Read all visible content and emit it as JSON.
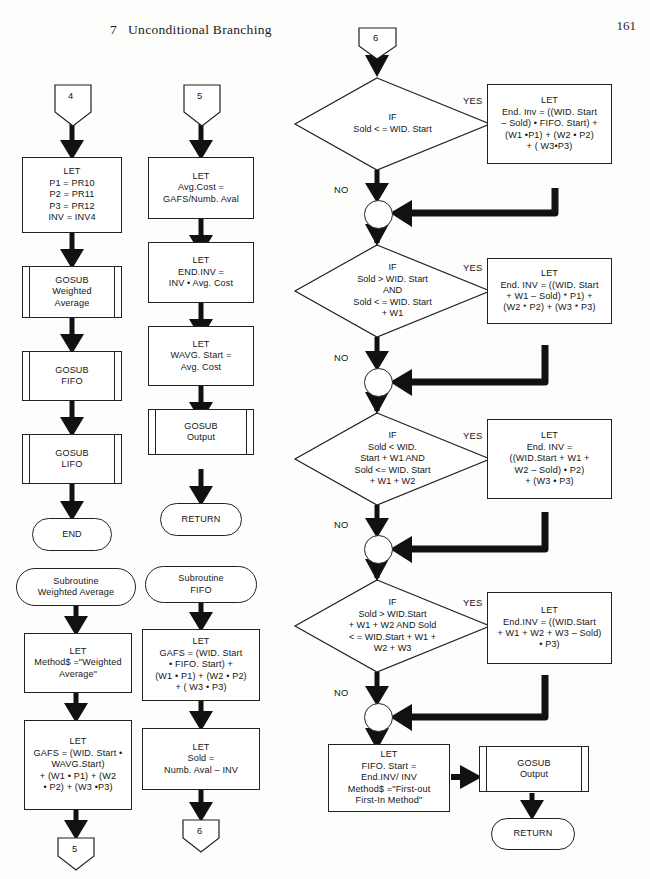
{
  "header": {
    "chapter_number": "7",
    "chapter_title": "Unconditional Branching",
    "page_number": "161"
  },
  "labels": {
    "yes": "YES",
    "no": "NO"
  },
  "column1": {
    "entry_connector": "4",
    "nodes": [
      {
        "id": "c1-let1",
        "type": "process",
        "text": "LET\nP1 = PR10\nP2 = PR11\nP3 = PR12\nINV = INV4"
      },
      {
        "id": "c1-sub1",
        "type": "subroutine",
        "text": "GOSUB\nWeighted\nAverage"
      },
      {
        "id": "c1-sub2",
        "type": "subroutine",
        "text": "GOSUB\nFIFO"
      },
      {
        "id": "c1-sub3",
        "type": "subroutine",
        "text": "GOSUB\nLIFO"
      },
      {
        "id": "c1-end",
        "type": "terminator",
        "text": "END"
      }
    ]
  },
  "column2": {
    "entry_connector": "5",
    "nodes": [
      {
        "id": "c2-let1",
        "type": "process",
        "text": "LET\nAvg.Cost =\nGAFS/Numb. Aval"
      },
      {
        "id": "c2-let2",
        "type": "process",
        "text": "LET\nEND.INV =\nINV • Avg. Cost"
      },
      {
        "id": "c2-let3",
        "type": "process",
        "text": "LET\nWAVG. Start =\nAvg. Cost"
      },
      {
        "id": "c2-sub1",
        "type": "subroutine",
        "text": "GOSUB\nOutput"
      },
      {
        "id": "c2-ret",
        "type": "terminator",
        "text": "RETURN"
      }
    ]
  },
  "subroutine_weighted_average": {
    "start_label": "Subroutine\nWeighted Average",
    "nodes": [
      {
        "id": "wa-let1",
        "type": "process",
        "text": "LET\nMethod$ =\"Weighted\nAverage\""
      },
      {
        "id": "wa-let2",
        "type": "process",
        "text": "LET\nGAFS = (WID. Start •\nWAVG.Start)\n+ (W1 • P1) + (W2\n• P2) + (W3 •P3)"
      }
    ],
    "exit_connector": "5"
  },
  "subroutine_fifo": {
    "start_label": "Subroutine\nFIFO",
    "nodes": [
      {
        "id": "fi-let1",
        "type": "process",
        "text": "LET\nGAFS = (WID. Start\n• FIFO. Start) +\n(W1 • P1) + (W2 • P2)\n+ ( W3 • P3)"
      },
      {
        "id": "fi-let2",
        "type": "process",
        "text": "LET\nSold =\nNumb. Aval – INV"
      }
    ],
    "exit_connector": "6"
  },
  "main_flow": {
    "entry_connector": "6",
    "decisions": [
      {
        "id": "d1",
        "text": "IF\nSold < = WID. Start"
      },
      {
        "id": "d2",
        "text": "IF\nSold > WID. Start\nAND\nSold < = WID. Start\n+ W1"
      },
      {
        "id": "d3",
        "text": "IF\nSold < WID.\nStart + W1 AND\nSold <= WID. Start\n+ W1 + W2"
      },
      {
        "id": "d4",
        "text": "IF\nSold > WID.Start\n+ W1 + W2 AND Sold\n< = WID.Start + W1 +\nW2 + W3"
      }
    ],
    "yes_boxes": [
      {
        "id": "y1",
        "text": "LET\nEnd. Inv = ((WID. Start\n– Sold) • FIFO. Start) +\n(W1 •P1) + (W2 • P2)\n+ ( W3•P3)"
      },
      {
        "id": "y2",
        "text": "LET\nEnd. INV = ((WID. Start\n+ W1 – Sold) * P1) +\n(W2 * P2) + (W3 * P3)"
      },
      {
        "id": "y3",
        "text": "LET\nEnd. INV =\n((WID.Start + W1 +\nW2 – Sold) • P2)\n+ (W3 • P3)"
      },
      {
        "id": "y4",
        "text": "LET\nEnd.INV = ((WID.Start\n+ W1 + W2 + W3 – Sold)\n• P3)"
      }
    ],
    "final_let": {
      "id": "m-let",
      "type": "process",
      "text": "LET\nFIFO. Start =\nEnd.INV/ INV\nMethod$ =\"First-out\nFirst-In Method\""
    },
    "final_gosub": {
      "id": "m-sub",
      "type": "subroutine",
      "text": "GOSUB\nOutput"
    },
    "final_return": {
      "id": "m-ret",
      "type": "terminator",
      "text": "RETURN"
    }
  },
  "colors": {
    "ink": "#151515",
    "stroke": "#222222",
    "paper": "#fdfdfc"
  }
}
